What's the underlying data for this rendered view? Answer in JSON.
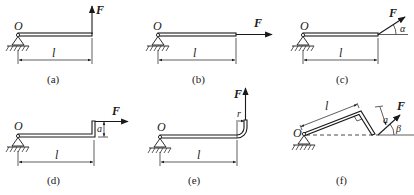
{
  "figure": {
    "panels": [
      {
        "id": "a",
        "caption": "(a)",
        "origin_label": "O",
        "length_label": "l",
        "force_label": "F",
        "force_direction": "vertical-up"
      },
      {
        "id": "b",
        "caption": "(b)",
        "origin_label": "O",
        "length_label": "l",
        "force_label": "F",
        "force_direction": "horizontal-right"
      },
      {
        "id": "c",
        "caption": "(c)",
        "origin_label": "O",
        "length_label": "l",
        "force_label": "F",
        "angle_label": "α",
        "force_direction": "inclined"
      },
      {
        "id": "d",
        "caption": "(d)",
        "origin_label": "O",
        "length_label": "l",
        "force_label": "F",
        "offset_label": "a",
        "force_direction": "horizontal-right"
      },
      {
        "id": "e",
        "caption": "(e)",
        "origin_label": "O",
        "length_label": "l",
        "force_label": "F",
        "radius_label": "r",
        "force_direction": "vertical-up"
      },
      {
        "id": "f",
        "caption": "(f)",
        "origin_label": "O",
        "length_label": "l",
        "force_label": "F",
        "offset_label": "a",
        "angle_label": "β",
        "force_direction": "inclined"
      }
    ]
  }
}
